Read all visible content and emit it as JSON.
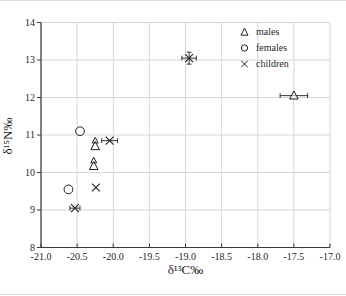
{
  "style": {
    "ink": "#1f1f1f",
    "axis_color": "#3a3a3a",
    "grid_color": "#d6d6d6",
    "background": "#ffffff"
  },
  "legend": {
    "items": [
      {
        "label": "males",
        "marker": "triangle"
      },
      {
        "label": "females",
        "marker": "circle"
      },
      {
        "label": "children",
        "marker": "x"
      }
    ]
  },
  "chart_data": {
    "type": "scatter",
    "title": "",
    "xlabel": "δ¹³C‰",
    "ylabel": "δ¹⁵N‰",
    "xlim": [
      -21.0,
      -17.0
    ],
    "ylim": [
      8,
      14
    ],
    "x_ticks": [
      -21.0,
      -20.5,
      -20.0,
      -19.5,
      -19.0,
      -18.5,
      -18.0,
      -17.5,
      -17.0
    ],
    "x_tick_labels": [
      "-21.0",
      "-20.5",
      "-20.0",
      "-19.5",
      "-19.0",
      "-18.5",
      "-18.0",
      "-17.5",
      "-17.0"
    ],
    "y_ticks": [
      8,
      9,
      10,
      11,
      12,
      13,
      14
    ],
    "y_tick_labels": [
      "8",
      "9",
      "10",
      "11",
      "12",
      "13",
      "14"
    ],
    "grid": true,
    "legend_position": "upper right",
    "series": [
      {
        "name": "males",
        "marker": "triangle",
        "points": [
          {
            "x": -20.25,
            "y": 10.85,
            "size": "small"
          },
          {
            "x": -20.25,
            "y": 10.7
          },
          {
            "x": -20.27,
            "y": 10.32,
            "size": "small"
          },
          {
            "x": -20.27,
            "y": 10.17
          },
          {
            "x": -17.5,
            "y": 12.05,
            "xerr": 0.19
          }
        ]
      },
      {
        "name": "females",
        "marker": "circle",
        "points": [
          {
            "x": -20.46,
            "y": 11.1
          },
          {
            "x": -20.62,
            "y": 9.55
          }
        ]
      },
      {
        "name": "children",
        "marker": "x",
        "points": [
          {
            "x": -20.05,
            "y": 10.85,
            "xerr": 0.11
          },
          {
            "x": -20.24,
            "y": 9.6
          },
          {
            "x": -20.53,
            "y": 9.05,
            "xerr": 0.07
          },
          {
            "x": -18.95,
            "y": 13.05,
            "xerr": 0.1,
            "yerr": 0.16
          }
        ]
      }
    ]
  }
}
